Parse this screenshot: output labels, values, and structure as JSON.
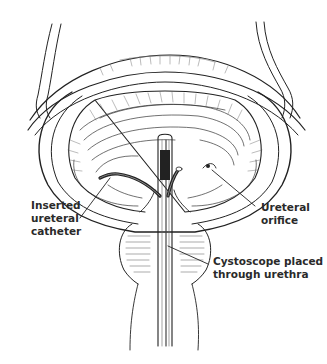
{
  "figure": {
    "labels": {
      "catheter": [
        "Inserted",
        "ureteral",
        "catheter"
      ],
      "orifice": [
        "Ureteral",
        "orifice"
      ],
      "cystoscope": [
        "Cystoscope placed",
        "through urethra"
      ]
    }
  },
  "colors": {
    "ink": "#222222",
    "background": "#ffffff",
    "hatch": "#555555"
  }
}
